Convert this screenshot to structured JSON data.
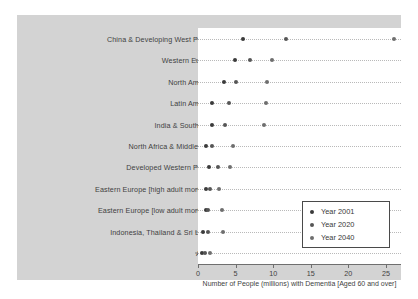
{
  "chart_data": {
    "type": "scatter",
    "title": "",
    "xlabel": "Number of People (millions) with Dementia [Aged 60 and over]",
    "ylabel": "",
    "xlim": [
      0,
      27
    ],
    "xticks": [
      0,
      5,
      10,
      15,
      20,
      25
    ],
    "xticklabels": [
      "0",
      "5",
      "10",
      "15",
      "20",
      "25"
    ],
    "grid": true,
    "legend_position": "lower right",
    "categories": [
      "China & Developing West Pacific",
      "Western Europe",
      "North America",
      "Latin America",
      "India & South Asia",
      "North Africa & Middle East",
      "Developed Western Pacific",
      "Eastern Europe [high adult mortality]",
      "Eastern Europe [low adult mortality]",
      "Indonesia, Thailand & Sri Lanka",
      "Africa"
    ],
    "series": [
      {
        "name": "Year 2001",
        "color": "#3a3a3a",
        "values": [
          6.0,
          4.9,
          3.4,
          1.8,
          1.8,
          1.0,
          1.5,
          1.0,
          1.0,
          0.6,
          0.5
        ]
      },
      {
        "name": "Year 2020",
        "color": "#555555",
        "values": [
          11.7,
          6.9,
          5.1,
          4.1,
          3.6,
          1.9,
          2.6,
          1.6,
          1.3,
          1.3,
          0.9
        ]
      },
      {
        "name": "Year 2040",
        "color": "#6e6e6e",
        "values": [
          26.1,
          9.9,
          9.2,
          9.1,
          8.8,
          4.7,
          4.3,
          2.8,
          3.2,
          3.3,
          1.6
        ]
      }
    ]
  },
  "legend": {
    "entries": [
      {
        "label": "Year 2001"
      },
      {
        "label": "Year 2020"
      },
      {
        "label": "Year 2040"
      }
    ]
  }
}
